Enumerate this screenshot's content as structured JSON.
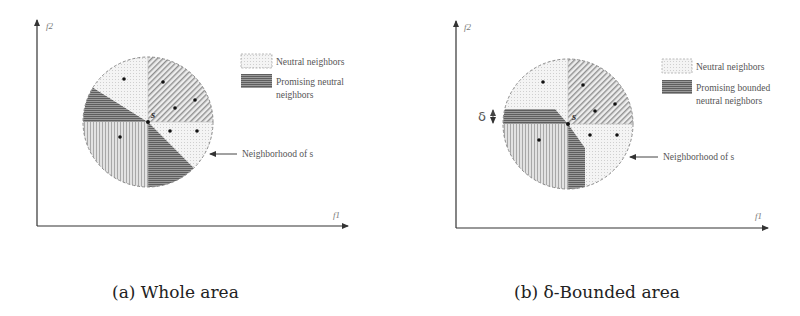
{
  "panels": [
    {
      "id": "a",
      "caption": "(a) Whole area",
      "axes": {
        "x_label": "f1",
        "y_label": "f2"
      },
      "center_label": "s",
      "legend": [
        {
          "label": "Neutral neighbors",
          "pattern": "dotted"
        },
        {
          "label_line1": "Promising neutral",
          "label_line2": "neighbors",
          "pattern": "dark-horizontal"
        }
      ],
      "annotation": "Neighborhood of s"
    },
    {
      "id": "b",
      "caption": "(b) δ-Bounded area",
      "axes": {
        "x_label": "f1",
        "y_label": "f2"
      },
      "center_label": "s",
      "delta_label": "δ",
      "legend": [
        {
          "label": "Neutral neighbors",
          "pattern": "dotted"
        },
        {
          "label_line1": "Promising bounded",
          "label_line2": "neutral neighbors",
          "pattern": "dark-horizontal"
        }
      ],
      "annotation": "Neighborhood of s"
    }
  ],
  "colors": {
    "axis": "#333333",
    "dark_fill": "#8a8a8a",
    "light_fill": "#f1f1f1",
    "vertical_fill": "#d4d4d4",
    "diagonal_fill": "#e6e6e6",
    "circle_border": "#888888",
    "text": "#555555"
  }
}
